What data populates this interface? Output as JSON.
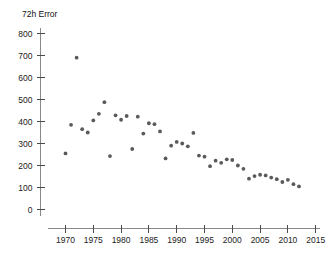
{
  "chart_data": {
    "type": "scatter",
    "title": "72h Error",
    "xlabel": "",
    "ylabel": "",
    "xlim": [
      1967,
      2016
    ],
    "ylim": [
      0,
      850
    ],
    "xticks": [
      1970,
      1975,
      1980,
      1985,
      1990,
      1995,
      2000,
      2005,
      2010,
      2015
    ],
    "yticks": [
      0,
      100,
      200,
      300,
      400,
      500,
      600,
      700,
      800
    ],
    "grid": false,
    "legend": null,
    "marker_color": "#5a5a5c",
    "axis_color": "#8a8a8a",
    "x": [
      1970,
      1971,
      1972,
      1973,
      1974,
      1975,
      1976,
      1977,
      1978,
      1979,
      1980,
      1981,
      1982,
      1983,
      1984,
      1985,
      1986,
      1987,
      1988,
      1989,
      1990,
      1991,
      1992,
      1993,
      1994,
      1995,
      1996,
      1997,
      1998,
      1999,
      2000,
      2001,
      2002,
      2003,
      2004,
      2005,
      2006,
      2007,
      2008,
      2009,
      2010,
      2011,
      2012
    ],
    "y": [
      255,
      385,
      690,
      365,
      350,
      405,
      435,
      488,
      243,
      428,
      408,
      425,
      275,
      422,
      345,
      392,
      388,
      355,
      232,
      290,
      307,
      300,
      287,
      348,
      245,
      240,
      197,
      222,
      212,
      228,
      225,
      200,
      185,
      140,
      152,
      158,
      155,
      145,
      138,
      125,
      135,
      115,
      105
    ],
    "series": [
      {
        "name": "72h Error",
        "points": [
          {
            "year": 1970,
            "value": 255
          },
          {
            "year": 1971,
            "value": 385
          },
          {
            "year": 1972,
            "value": 690
          },
          {
            "year": 1973,
            "value": 365
          },
          {
            "year": 1974,
            "value": 350
          },
          {
            "year": 1975,
            "value": 405
          },
          {
            "year": 1976,
            "value": 435
          },
          {
            "year": 1977,
            "value": 488
          },
          {
            "year": 1978,
            "value": 243
          },
          {
            "year": 1979,
            "value": 428
          },
          {
            "year": 1980,
            "value": 408
          },
          {
            "year": 1981,
            "value": 425
          },
          {
            "year": 1982,
            "value": 275
          },
          {
            "year": 1983,
            "value": 422
          },
          {
            "year": 1984,
            "value": 345
          },
          {
            "year": 1985,
            "value": 392
          },
          {
            "year": 1986,
            "value": 388
          },
          {
            "year": 1987,
            "value": 355
          },
          {
            "year": 1988,
            "value": 232
          },
          {
            "year": 1989,
            "value": 290
          },
          {
            "year": 1990,
            "value": 307
          },
          {
            "year": 1991,
            "value": 300
          },
          {
            "year": 1992,
            "value": 287
          },
          {
            "year": 1993,
            "value": 348
          },
          {
            "year": 1994,
            "value": 245
          },
          {
            "year": 1995,
            "value": 240
          },
          {
            "year": 1996,
            "value": 197
          },
          {
            "year": 1997,
            "value": 222
          },
          {
            "year": 1998,
            "value": 212
          },
          {
            "year": 1999,
            "value": 228
          },
          {
            "year": 2000,
            "value": 225
          },
          {
            "year": 2001,
            "value": 200
          },
          {
            "year": 2002,
            "value": 185
          },
          {
            "year": 2003,
            "value": 140
          },
          {
            "year": 2004,
            "value": 152
          },
          {
            "year": 2005,
            "value": 158
          },
          {
            "year": 2006,
            "value": 155
          },
          {
            "year": 2007,
            "value": 145
          },
          {
            "year": 2008,
            "value": 138
          },
          {
            "year": 2009,
            "value": 125
          },
          {
            "year": 2010,
            "value": 135
          },
          {
            "year": 2011,
            "value": 115
          },
          {
            "year": 2012,
            "value": 105
          }
        ]
      }
    ]
  }
}
